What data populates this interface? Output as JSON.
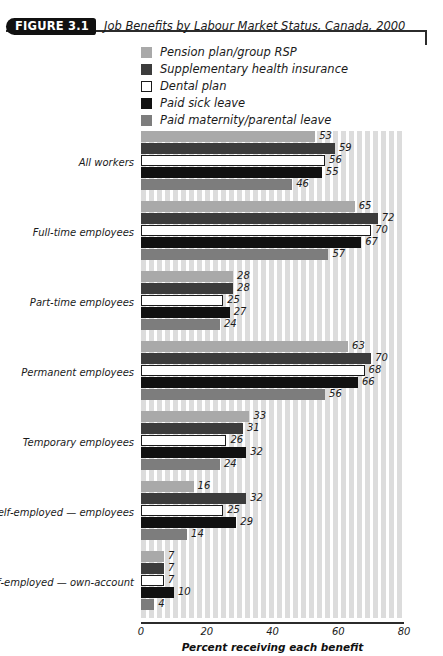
{
  "header": {
    "badge": "FIGURE 3.1",
    "title": "Job Benefits by Labour Market Status, Canada, 2000"
  },
  "chart_data": {
    "type": "bar",
    "orientation": "horizontal",
    "title": "Job Benefits by Labour Market Status, Canada, 2000",
    "xlabel": "Percent receiving each benefit",
    "ylabel": "",
    "xlim": [
      0,
      80
    ],
    "xticks": [
      0,
      20,
      40,
      60,
      80
    ],
    "grid": "vertical-stripes",
    "legend_position": "top",
    "categories": [
      "All workers",
      "Full-time employees",
      "Part-time employees",
      "Permanent employees",
      "Temporary employees",
      "Self-employed — employees",
      "Self-employed — own-account"
    ],
    "series": [
      {
        "name": "Pension plan/group RSP",
        "color": "#a9a9a9",
        "border": "none",
        "values": [
          53,
          65,
          28,
          63,
          33,
          16,
          7
        ]
      },
      {
        "name": "Supplementary health insurance",
        "color": "#3c3c3c",
        "border": "none",
        "values": [
          59,
          72,
          28,
          70,
          31,
          32,
          7
        ]
      },
      {
        "name": "Dental plan",
        "color": "#ffffff",
        "border": "#1a1a1a",
        "values": [
          56,
          70,
          25,
          68,
          26,
          25,
          7
        ]
      },
      {
        "name": "Paid sick leave",
        "color": "#111111",
        "border": "none",
        "values": [
          55,
          67,
          27,
          66,
          32,
          29,
          10
        ]
      },
      {
        "name": "Paid maternity/parental leave",
        "color": "#7d7d7d",
        "border": "none",
        "values": [
          46,
          57,
          24,
          56,
          24,
          14,
          4
        ]
      }
    ]
  }
}
